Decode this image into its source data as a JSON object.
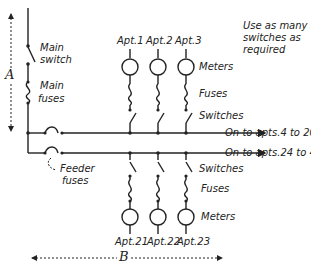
{
  "diagram": {
    "note": [
      "Use as many",
      "switches as",
      "required"
    ],
    "main_switch": [
      "Main",
      "switch"
    ],
    "main_fuses": [
      "Main",
      "fuses"
    ],
    "feeder_fuses": [
      "Feeder",
      "fuses"
    ],
    "dimension_a": "A",
    "dimension_b": "B",
    "upper_bus_label": "On to apts.4 to 20",
    "lower_bus_label": "On to apts.24 to 40",
    "upper_labels": {
      "meters": "Meters",
      "fuses": "Fuses",
      "switches": "Switches"
    },
    "lower_labels": {
      "switches": "Switches",
      "fuses": "Fuses",
      "meters": "Meters"
    },
    "upper_apts": [
      "Apt.1",
      "Apt.2",
      "Apt.3"
    ],
    "lower_apts": [
      "Apt.21",
      "Apt.22",
      "Apt.23"
    ],
    "line_color": "#222222"
  }
}
